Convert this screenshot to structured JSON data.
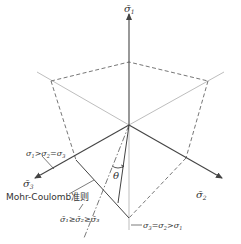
{
  "diagram": {
    "axes": {
      "sigma1": {
        "label": "σ̄₁",
        "text": "σ̄",
        "sub": "1"
      },
      "sigma2": {
        "label": "σ̄₂",
        "text": "σ̄",
        "sub": "2"
      },
      "sigma3": {
        "label": "σ̄₃",
        "text": "σ̄",
        "sub": "3"
      }
    },
    "annotations": {
      "compression_meridian": {
        "text": "σ₁>σ₂=σ₃",
        "parts": [
          "σ",
          "1",
          ">σ",
          "2",
          "=σ",
          "3"
        ]
      },
      "mohr_coulomb": {
        "text": "Mohr-Coulomb准则"
      },
      "ordering": {
        "text": "σ̄₁≥σ̄₂≥σ̄₃"
      },
      "extension_meridian": {
        "text": "σ₃=σ₂>σ₁",
        "parts": [
          "σ",
          "3",
          "=σ",
          "2",
          ">σ",
          "1"
        ]
      },
      "angle": {
        "text": "θ"
      }
    },
    "colors": {
      "axis": "#444444",
      "light_line": "#b5b5b5",
      "dashed": "#666666",
      "text": "#333333"
    }
  }
}
